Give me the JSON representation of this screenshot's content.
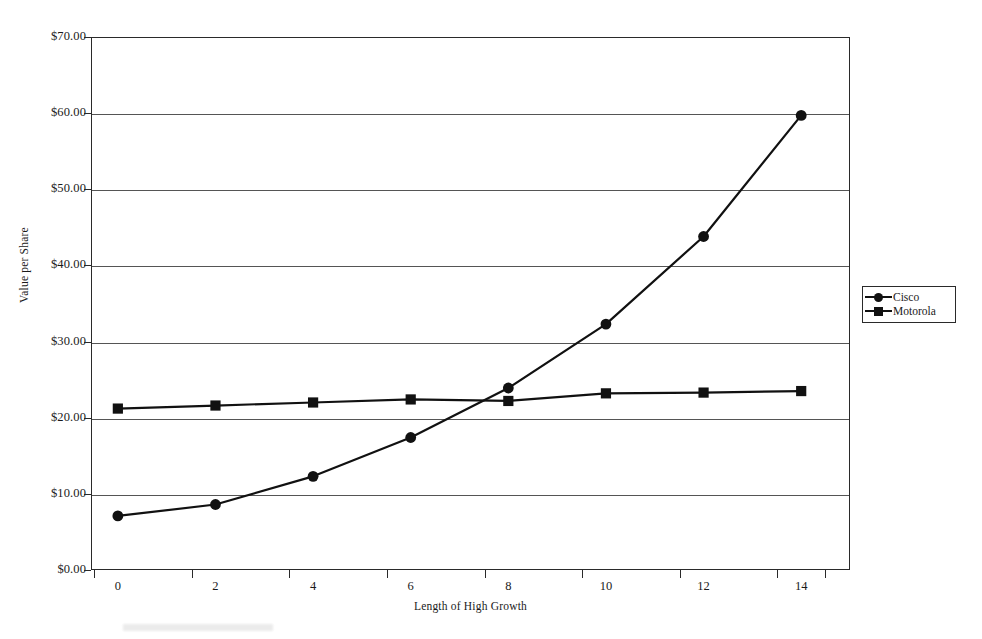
{
  "chart_data": {
    "type": "line",
    "title": "",
    "xlabel": "Length of High Growth",
    "ylabel": "Value per Share",
    "x": [
      0,
      2,
      4,
      6,
      8,
      10,
      12,
      14
    ],
    "xtick_labels": [
      "0",
      "2",
      "4",
      "6",
      "8",
      "10",
      "12",
      "14"
    ],
    "ytick_labels": [
      "$0.00",
      "$10.00",
      "$20.00",
      "$30.00",
      "$40.00",
      "$50.00",
      "$60.00",
      "$70.00"
    ],
    "ytick_values": [
      0,
      10,
      20,
      30,
      40,
      50,
      60,
      70
    ],
    "xlim": [
      -0.55,
      15.0
    ],
    "ylim": [
      0,
      70
    ],
    "grid": "horizontal",
    "legend_position": "right-outside",
    "series": [
      {
        "name": "Cisco",
        "marker": "circle",
        "color": "#111111",
        "values": [
          7.1,
          8.6,
          12.3,
          17.4,
          23.9,
          32.3,
          43.8,
          59.7
        ]
      },
      {
        "name": "Motorola",
        "marker": "square",
        "color": "#111111",
        "values": [
          21.2,
          21.6,
          22.0,
          22.4,
          22.2,
          23.2,
          23.3,
          23.5
        ]
      }
    ]
  },
  "legend": {
    "entries": [
      {
        "label": "Cisco",
        "marker": "circle-marker-icon"
      },
      {
        "label": "Motorola",
        "marker": "square-marker-icon"
      }
    ]
  },
  "axes": {
    "y_title": "Value per Share",
    "x_title": "Length of High Growth"
  }
}
